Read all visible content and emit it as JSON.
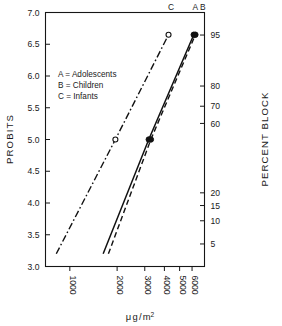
{
  "chart_data": {
    "type": "line",
    "title": "",
    "xlabel": "μ g / m²",
    "ylabel": "PROBITS",
    "y2label": "PERCENT BLOCK",
    "xscale": "log",
    "xlim": [
      700,
      7200
    ],
    "ylim": [
      3.0,
      7.0
    ],
    "grid": false,
    "legend_position": "upper-left-inside",
    "xticks": [
      1000,
      2000,
      3000,
      4000,
      5000,
      6000
    ],
    "xticklabels": [
      "1000",
      "2000",
      "3000",
      "4000",
      "5000",
      "6000"
    ],
    "yticks": [
      3.0,
      3.5,
      4.0,
      4.5,
      5.0,
      5.5,
      6.0,
      6.5,
      7.0
    ],
    "yticklabels": [
      "3.0",
      "3.5",
      "4.0",
      "4.5",
      "5.0",
      "5.5",
      "6.0",
      "6.5",
      "7.0"
    ],
    "y2ticks_probit": [
      6.645,
      5.842,
      5.524,
      5.253,
      4.16,
      3.96,
      3.72,
      3.355
    ],
    "y2ticklabels": [
      "95",
      "80",
      "70",
      "60",
      "20",
      "15",
      "10",
      "5"
    ],
    "legend": [
      {
        "key": "A",
        "label": "A = Adolescents"
      },
      {
        "key": "B",
        "label": "B = Children"
      },
      {
        "key": "C",
        "label": "C = Infants"
      }
    ],
    "series": [
      {
        "name": "A",
        "label": "Adolescents",
        "linestyle": "solid",
        "endlabel": "A",
        "marker": "filled-circle",
        "x": [
          1630,
          3180,
          6150
        ],
        "y": [
          3.2,
          5.0,
          6.65
        ],
        "points": [
          {
            "x": 3180,
            "y": 5.0
          },
          {
            "x": 6150,
            "y": 6.65
          }
        ]
      },
      {
        "name": "B",
        "label": "Children",
        "linestyle": "dashed",
        "endlabel": "B",
        "marker": "filled-circle",
        "x": [
          1760,
          3280,
          6300
        ],
        "y": [
          3.2,
          5.0,
          6.65
        ],
        "points": [
          {
            "x": 3280,
            "y": 5.0
          },
          {
            "x": 6300,
            "y": 6.65
          }
        ]
      },
      {
        "name": "C",
        "label": "Infants",
        "linestyle": "dashdot",
        "endlabel": "C",
        "marker": "open-circle",
        "x": [
          820,
          1950,
          4250
        ],
        "y": [
          3.2,
          5.0,
          6.65
        ],
        "points": [
          {
            "x": 1950,
            "y": 5.0
          },
          {
            "x": 4250,
            "y": 6.65
          }
        ]
      }
    ]
  }
}
